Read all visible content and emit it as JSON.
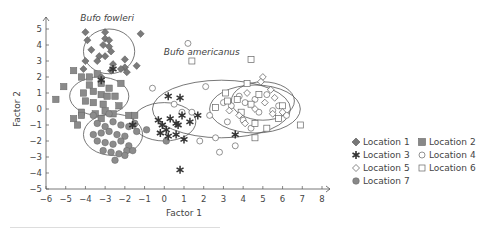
{
  "chart_data": {
    "type": "scatter",
    "title": "",
    "xlabel": "Factor 1",
    "ylabel": "Factor 2",
    "xlim": [
      -6,
      8
    ],
    "ylim": [
      -5,
      5
    ],
    "xticks": [
      "-6",
      "-5",
      "-4",
      "-3",
      "-2",
      "-1",
      "0",
      "1",
      "2",
      "3",
      "4",
      "5",
      "6",
      "7",
      "8"
    ],
    "yticks": [
      "-5",
      "-4",
      "-3",
      "-2",
      "-1",
      "0",
      "1",
      "2",
      "3",
      "4",
      "5"
    ],
    "annotations": [
      {
        "text": "Bufo fowleri",
        "x": -2.9,
        "y": 5.5
      },
      {
        "text": "Bufo americanus",
        "x": 1.9,
        "y": 3.4
      }
    ],
    "legend": [
      "Location 1",
      "Location 2",
      "Location 3",
      "Location 4",
      "Location 5",
      "Location 6",
      "Location 7"
    ],
    "ellipses": [
      {
        "cx": -2.8,
        "cy": 3.6,
        "rx": 1.3,
        "ry": 1.4
      },
      {
        "cx": -3.3,
        "cy": 0.8,
        "rx": 1.5,
        "ry": 1.2
      },
      {
        "cx": -2.6,
        "cy": -1.6,
        "rx": 1.5,
        "ry": 1.3
      },
      {
        "cx": 0.0,
        "cy": -0.8,
        "rx": 1.6,
        "ry": 1.2
      },
      {
        "cx": 2.9,
        "cy": 0.0,
        "rx": 3.5,
        "ry": 1.8
      },
      {
        "cx": 4.6,
        "cy": 0.0,
        "rx": 2.3,
        "ry": 1.5
      },
      {
        "cx": 5.0,
        "cy": 0.5,
        "rx": 1.6,
        "ry": 1.2
      }
    ],
    "series": [
      {
        "name": "Location 1",
        "marker": "diamond-filled",
        "points": [
          [
            -4,
            4.8
          ],
          [
            -3,
            4.8
          ],
          [
            -1.2,
            4.7
          ],
          [
            -3.9,
            4.3
          ],
          [
            -3,
            4.4
          ],
          [
            -2.8,
            4.3
          ],
          [
            -3.1,
            4.0
          ],
          [
            -2.8,
            3.9
          ],
          [
            -3.7,
            3.7
          ],
          [
            -2.7,
            3.6
          ],
          [
            -3.3,
            3.3
          ],
          [
            -3.0,
            3.3
          ],
          [
            -3.4,
            3.0
          ],
          [
            -2.0,
            3.1
          ],
          [
            -4.0,
            3.0
          ],
          [
            -2.6,
            2.8
          ],
          [
            -1.4,
            2.7
          ],
          [
            -2.0,
            2.6
          ],
          [
            -4.1,
            2.5
          ],
          [
            -2.7,
            2.4
          ],
          [
            -2.2,
            2.5
          ],
          [
            -3.2,
            2.0
          ],
          [
            -1.9,
            2.3
          ]
        ]
      },
      {
        "name": "Location 2",
        "marker": "square-filled",
        "points": [
          [
            -5.5,
            0.6
          ],
          [
            -5.1,
            1.4
          ],
          [
            -4.6,
            2.4
          ],
          [
            -4.2,
            2.0
          ],
          [
            -3.8,
            2.0
          ],
          [
            -3.4,
            2.2
          ],
          [
            -2.2,
            1.6
          ],
          [
            -3.8,
            1.5
          ],
          [
            -3.2,
            1.6
          ],
          [
            -2.8,
            1.3
          ],
          [
            -4.1,
            1.0
          ],
          [
            -3.6,
            1.1
          ],
          [
            -3.2,
            0.9
          ],
          [
            -2.9,
            0.8
          ],
          [
            -2.5,
            0.8
          ],
          [
            -4.0,
            0.5
          ],
          [
            -3.6,
            0.4
          ],
          [
            -3.1,
            0.3
          ],
          [
            -2.3,
            0.2
          ],
          [
            -4.2,
            -0.2
          ],
          [
            -3.5,
            -0.3
          ],
          [
            -3.0,
            -0.1
          ],
          [
            -2.6,
            -0.3
          ],
          [
            -4.6,
            -0.6
          ],
          [
            -4.2,
            -0.4
          ],
          [
            -4.4,
            -1.0
          ],
          [
            -3.2,
            -0.6
          ],
          [
            -1.8,
            -0.4
          ],
          [
            -1.5,
            -0.4
          ]
        ]
      },
      {
        "name": "Location 3",
        "marker": "star",
        "points": [
          [
            0.2,
            0.8
          ],
          [
            0.8,
            0.7
          ],
          [
            -1.6,
            -1.0
          ],
          [
            1.7,
            -0.4
          ],
          [
            -0.1,
            -1.0
          ],
          [
            0.3,
            -0.6
          ],
          [
            0.6,
            -0.9
          ],
          [
            0.9,
            -0.4
          ],
          [
            0.1,
            -1.3
          ],
          [
            0.7,
            -1.0
          ],
          [
            1.3,
            -0.8
          ],
          [
            0.6,
            -1.6
          ],
          [
            1.0,
            -1.9
          ],
          [
            0.2,
            -1.7
          ],
          [
            -0.3,
            -0.7
          ],
          [
            -0.2,
            -1.5
          ],
          [
            3.6,
            -1.6
          ],
          [
            0.8,
            -3.8
          ],
          [
            -3.2,
            1.8
          ],
          [
            -2.6,
            2.5
          ]
        ]
      },
      {
        "name": "Location 4",
        "marker": "circle-open",
        "points": [
          [
            -0.6,
            1.3
          ],
          [
            1.2,
            4.1
          ],
          [
            0.5,
            0.3
          ],
          [
            0.9,
            -0.2
          ],
          [
            2.1,
            1.4
          ],
          [
            1.4,
            -0.2
          ],
          [
            2.3,
            -0.4
          ],
          [
            1.8,
            -2.0
          ],
          [
            2.6,
            -1.8
          ],
          [
            2.8,
            -2.7
          ],
          [
            3.2,
            -0.8
          ],
          [
            3.6,
            -2.3
          ],
          [
            3.0,
            0.4
          ],
          [
            3.4,
            0.2
          ],
          [
            3.8,
            0.8
          ],
          [
            4.1,
            0.4
          ],
          [
            4.6,
            0.6
          ],
          [
            5.2,
            0.9
          ],
          [
            4.8,
            -0.2
          ],
          [
            5.5,
            -0.1
          ],
          [
            5.8,
            0.2
          ],
          [
            6.2,
            -0.4
          ],
          [
            4.4,
            -1.2
          ],
          [
            4.0,
            -0.7
          ]
        ]
      },
      {
        "name": "Location 5",
        "marker": "diamond-open",
        "points": [
          [
            5.0,
            2.0
          ],
          [
            4.9,
            1.7
          ],
          [
            4.2,
            1.0
          ],
          [
            5.4,
            1.2
          ],
          [
            5.6,
            0.7
          ],
          [
            5.1,
            0.4
          ],
          [
            4.6,
            0.0
          ],
          [
            3.3,
            -0.1
          ],
          [
            3.8,
            -0.4
          ],
          [
            5.5,
            -0.3
          ],
          [
            4.1,
            -0.9
          ],
          [
            6.0,
            -0.2
          ]
        ]
      },
      {
        "name": "Location 6",
        "marker": "square-open",
        "points": [
          [
            4.4,
            3.1
          ],
          [
            1.4,
            3.0
          ],
          [
            4.2,
            1.6
          ],
          [
            6.0,
            0.2
          ],
          [
            6.9,
            -1.0
          ],
          [
            4.6,
            -1.8
          ],
          [
            5.2,
            -1.2
          ],
          [
            3.7,
            0.6
          ],
          [
            4.4,
            0.3
          ],
          [
            3.2,
            0.5
          ],
          [
            5.8,
            -0.6
          ],
          [
            4.8,
            0.9
          ],
          [
            3.9,
            -0.2
          ],
          [
            4.6,
            -0.9
          ],
          [
            3.1,
            1.0
          ],
          [
            2.6,
            0.1
          ]
        ]
      },
      {
        "name": "Location 7",
        "marker": "circle-filled",
        "points": [
          [
            -3.4,
            -0.9
          ],
          [
            -3.0,
            -1.1
          ],
          [
            -2.6,
            -0.8
          ],
          [
            -2.2,
            -1.0
          ],
          [
            -1.8,
            -1.1
          ],
          [
            -1.4,
            -1.4
          ],
          [
            -3.6,
            -1.6
          ],
          [
            -3.2,
            -1.5
          ],
          [
            -2.8,
            -1.4
          ],
          [
            -2.4,
            -1.6
          ],
          [
            -2.0,
            -1.7
          ],
          [
            -3.4,
            -2.0
          ],
          [
            -3.0,
            -2.1
          ],
          [
            -2.6,
            -2.2
          ],
          [
            -2.2,
            -2.0
          ],
          [
            -1.8,
            -2.3
          ],
          [
            -3.1,
            -2.6
          ],
          [
            -2.7,
            -2.7
          ],
          [
            -2.3,
            -2.8
          ],
          [
            -1.9,
            -2.6
          ],
          [
            -2.5,
            -3.2
          ],
          [
            -2.0,
            -2.9
          ],
          [
            -1.6,
            -2.6
          ],
          [
            -3.6,
            -0.4
          ],
          [
            -2.8,
            -0.3
          ],
          [
            -0.9,
            -1.3
          ],
          [
            0.1,
            -2.0
          ],
          [
            -1.5,
            -0.9
          ]
        ]
      }
    ]
  },
  "legend_labels": [
    "Location 1",
    "Location 2",
    "Location 3",
    "Location 4",
    "Location 5",
    "Location 6",
    "Location 7"
  ]
}
